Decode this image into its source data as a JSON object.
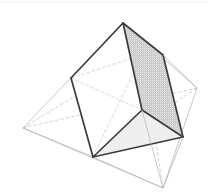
{
  "figure": {
    "title": "Inscribed triangular prism in an octahedron",
    "canvas": {
      "width": 210,
      "height": 195,
      "background": "#ffffff"
    },
    "colors": {
      "background": "#ffffff",
      "solid_outline": "#3c3c3c",
      "thin_edge": "#b4b4b4",
      "hidden_edge": "#c0c0c0",
      "shaded_face": "#c8c8c8",
      "shaded_face_light": "#ebebeb",
      "scan_artifact": "#f2f2f2"
    },
    "stroke_widths": {
      "solid_outline": 1.7,
      "thin_edge": 0.7,
      "hidden_edge": 0.7
    },
    "dash_pattern": "3 2.5",
    "octahedron": {
      "name": "outer-octahedron",
      "vertices": {
        "top": {
          "x": 123,
          "y": 23
        },
        "bottom": {
          "x": 163,
          "y": 188
        },
        "left": {
          "x": 23,
          "y": 128
        },
        "right": {
          "x": 197,
          "y": 88
        },
        "front": {
          "x": 93,
          "y": 157
        },
        "back": {
          "x": 142,
          "y": 55
        }
      },
      "visible_edges": [
        [
          "top",
          "left"
        ],
        [
          "top",
          "right"
        ],
        [
          "top",
          "front"
        ],
        [
          "left",
          "front"
        ],
        [
          "left",
          "bottom"
        ],
        [
          "front",
          "bottom"
        ],
        [
          "right",
          "bottom"
        ],
        [
          "top",
          "back"
        ],
        [
          "right",
          "back"
        ]
      ],
      "hidden_edges": [
        [
          "left",
          "back"
        ],
        [
          "front",
          "back"
        ],
        [
          "back",
          "bottom"
        ],
        [
          "left",
          "right"
        ],
        [
          "front",
          "right"
        ]
      ]
    },
    "prism": {
      "name": "inscribed-prism",
      "vertices": {
        "apex_top": {
          "x": 123,
          "y": 23
        },
        "edge_left": {
          "x": 71,
          "y": 78
        },
        "edge_right": {
          "x": 163,
          "y": 55
        },
        "base_front": {
          "x": 93,
          "y": 157
        },
        "base_mid": {
          "x": 142,
          "y": 110
        },
        "base_right": {
          "x": 183,
          "y": 137
        }
      },
      "bold_edges": [
        [
          "apex_top",
          "edge_left"
        ],
        [
          "apex_top",
          "edge_right"
        ],
        [
          "apex_top",
          "base_mid"
        ],
        [
          "edge_left",
          "base_front"
        ],
        [
          "edge_right",
          "base_right"
        ],
        [
          "base_front",
          "base_mid"
        ],
        [
          "base_front",
          "base_right"
        ],
        [
          "base_mid",
          "base_right"
        ],
        [
          "base_mid",
          "edge_right"
        ]
      ],
      "faces": [
        {
          "name": "right-face-shaded",
          "fill": "#c8c8c8",
          "points": "123,23 163,55 183,137 142,110"
        },
        {
          "name": "bottom-face-shaded",
          "fill": "#ebebeb",
          "points": "93,157 142,110 183,137"
        },
        {
          "name": "left-face-white",
          "fill": "#ffffff",
          "points": "123,23 71,78 93,157 142,110"
        }
      ]
    }
  }
}
